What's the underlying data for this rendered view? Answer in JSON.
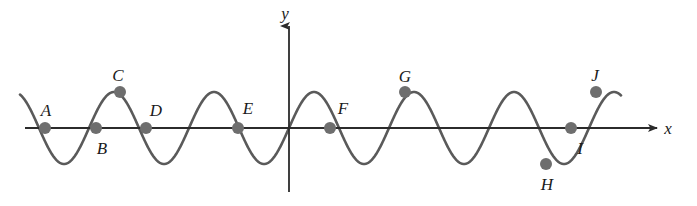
{
  "figure": {
    "type": "math-graph",
    "width": 697,
    "height": 206,
    "background_color": "#ffffff",
    "curve_color": "#5a5a5a",
    "axis_color": "#2b2b2b",
    "point_color": "#6e6e6e",
    "label_color": "#1a1a1a"
  },
  "axes": {
    "x_axis": {
      "label": "x",
      "label_x": 668,
      "label_y": 128,
      "start_x": 25,
      "end_x": 657,
      "y": 128,
      "arrow": "right"
    },
    "y_axis": {
      "label": "y",
      "label_x": 285,
      "label_y": 13,
      "x": 289,
      "start_y": 192,
      "end_y": 26,
      "arrow": "up"
    },
    "origin": {
      "x": 289,
      "y": 128
    }
  },
  "curve": {
    "amplitude_px": 36,
    "period_px": 100,
    "x_start": 20,
    "x_end": 621,
    "stroke_width": 2.6
  },
  "points": [
    {
      "id": "A",
      "label": "A",
      "x": 45,
      "y": 128,
      "label_x": 46,
      "label_y": 110,
      "kind": "zero-crossing"
    },
    {
      "id": "B",
      "label": "B",
      "x": 96,
      "y": 128,
      "label_x": 102,
      "label_y": 148,
      "kind": "zero-crossing"
    },
    {
      "id": "C",
      "label": "C",
      "x": 120,
      "y": 92,
      "label_x": 118,
      "label_y": 75,
      "kind": "maximum"
    },
    {
      "id": "D",
      "label": "D",
      "x": 146,
      "y": 128,
      "label_x": 156,
      "label_y": 110,
      "kind": "zero-crossing"
    },
    {
      "id": "E",
      "label": "E",
      "x": 238,
      "y": 128,
      "label_x": 248,
      "label_y": 108,
      "kind": "zero-crossing"
    },
    {
      "id": "F",
      "label": "F",
      "x": 330,
      "y": 128,
      "label_x": 343,
      "label_y": 108,
      "kind": "zero-crossing"
    },
    {
      "id": "G",
      "label": "G",
      "x": 405,
      "y": 92,
      "label_x": 405,
      "label_y": 76,
      "kind": "maximum"
    },
    {
      "id": "H",
      "label": "H",
      "x": 546,
      "y": 164,
      "label_x": 547,
      "label_y": 184,
      "kind": "minimum"
    },
    {
      "id": "I",
      "label": "I",
      "x": 571,
      "y": 128,
      "label_x": 580,
      "label_y": 148,
      "kind": "zero-crossing"
    },
    {
      "id": "J",
      "label": "J",
      "x": 596,
      "y": 92,
      "label_x": 595,
      "label_y": 75,
      "kind": "maximum"
    }
  ],
  "chart_data": {
    "type": "line",
    "title": "",
    "xlabel": "x",
    "ylabel": "y",
    "grid": false,
    "legend": null,
    "function": "sinusoid",
    "annotations": [
      "A",
      "B",
      "C",
      "D",
      "E",
      "F",
      "G",
      "H",
      "I",
      "J"
    ]
  }
}
